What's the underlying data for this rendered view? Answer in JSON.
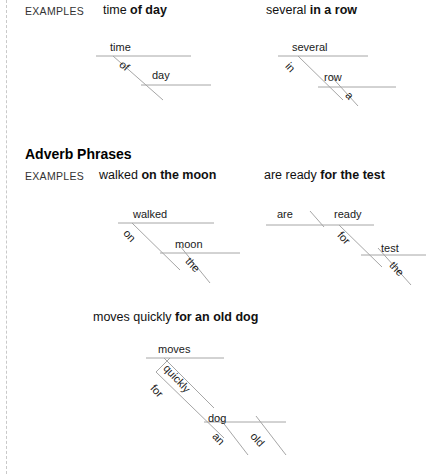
{
  "page": {
    "width": 431,
    "height": 474,
    "background": "#ffffff",
    "line_color": "#a6a6a6",
    "text_color": "#1a1a1a"
  },
  "sections": [
    {
      "id": "adjective-phrases-examples",
      "examples_label": "EXAMPLES",
      "heading": null,
      "items": [
        {
          "id": "time-of-day",
          "phrase_plain": "time ",
          "phrase_bold": "of day",
          "diagram_words": [
            {
              "text": "time",
              "role": "head-noun"
            },
            {
              "text": "of",
              "role": "preposition"
            },
            {
              "text": "day",
              "role": "object-of-preposition"
            }
          ]
        },
        {
          "id": "several-in-a-row",
          "phrase_plain": "several ",
          "phrase_bold": "in a row",
          "diagram_words": [
            {
              "text": "several",
              "role": "head-word"
            },
            {
              "text": "in",
              "role": "preposition"
            },
            {
              "text": "row",
              "role": "object-of-preposition"
            },
            {
              "text": "a",
              "role": "article-modifier"
            }
          ]
        }
      ]
    },
    {
      "id": "adverb-phrases",
      "heading": "Adverb Phrases",
      "examples_label": "EXAMPLES",
      "items": [
        {
          "id": "walked-on-the-moon",
          "phrase_plain": "walked ",
          "phrase_bold": "on the moon",
          "diagram_words": [
            {
              "text": "walked",
              "role": "verb"
            },
            {
              "text": "on",
              "role": "preposition"
            },
            {
              "text": "moon",
              "role": "object-of-preposition"
            },
            {
              "text": "the",
              "role": "article-modifier"
            }
          ]
        },
        {
          "id": "are-ready-for-the-test",
          "phrase_plain": "are ready ",
          "phrase_bold": "for the test",
          "diagram_words": [
            {
              "text": "are",
              "role": "subject"
            },
            {
              "text": "ready",
              "role": "predicate-adjective"
            },
            {
              "text": "for",
              "role": "preposition"
            },
            {
              "text": "test",
              "role": "object-of-preposition"
            },
            {
              "text": "the",
              "role": "article-modifier"
            }
          ]
        },
        {
          "id": "moves-quickly-for-an-old-dog",
          "phrase_plain": "moves quickly ",
          "phrase_bold": "for an old dog",
          "diagram_words": [
            {
              "text": "moves",
              "role": "verb"
            },
            {
              "text": "quickly",
              "role": "adverb"
            },
            {
              "text": "for",
              "role": "preposition"
            },
            {
              "text": "dog",
              "role": "object-of-preposition"
            },
            {
              "text": "an",
              "role": "article-modifier"
            },
            {
              "text": "old",
              "role": "adjective-modifier"
            }
          ]
        }
      ]
    }
  ]
}
